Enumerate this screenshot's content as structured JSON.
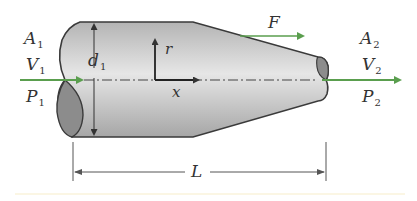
{
  "diagram": {
    "colors": {
      "body_light": "#e2e2e2",
      "body_dark": "#a9a9a9",
      "end_face": "#8c8c8c",
      "outline": "#3a3a3a",
      "flow_arrow": "#5a9e4e",
      "dimension": "#444444",
      "label": "#333333",
      "footer_strip": "#fbf6e4"
    },
    "inlet": {
      "area": "A",
      "area_sub": "1",
      "velocity": "V",
      "velocity_sub": "1",
      "pressure": "P",
      "pressure_sub": "1"
    },
    "outlet": {
      "area": "A",
      "area_sub": "2",
      "velocity": "V",
      "velocity_sub": "2",
      "pressure": "P",
      "pressure_sub": "2"
    },
    "diameter": {
      "symbol": "d",
      "sub": "1"
    },
    "force": {
      "symbol": "F"
    },
    "axes": {
      "radial": "r",
      "axial": "x"
    },
    "length": {
      "symbol": "L"
    }
  }
}
